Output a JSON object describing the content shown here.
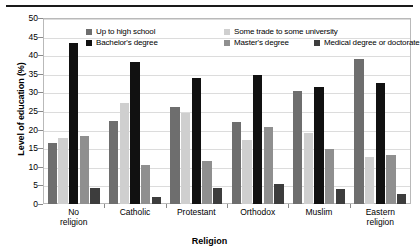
{
  "chart_data": {
    "type": "bar",
    "title": "",
    "xlabel": "Religion",
    "ylabel": "Level of education (%)",
    "ylim": [
      0,
      50
    ],
    "yticks": [
      0,
      5,
      10,
      15,
      20,
      25,
      30,
      35,
      40,
      45,
      50
    ],
    "grid": true,
    "legend_position": "top-inside",
    "categories": [
      "No\nreligion",
      "Catholic",
      "Protestant",
      "Orthodox",
      "Muslim",
      "Eastern\nreligion"
    ],
    "series": [
      {
        "name": "Up to high school",
        "color": "#6e6e6e",
        "values": [
          16.5,
          22.4,
          26.1,
          22.0,
          30.5,
          39.0
        ]
      },
      {
        "name": "Some trade to some university",
        "color": "#cfcfcf",
        "values": [
          17.7,
          27.1,
          24.4,
          17.1,
          19.2,
          12.7
        ]
      },
      {
        "name": "Bachelor's degree",
        "color": "#111111",
        "values": [
          43.3,
          38.1,
          33.9,
          34.6,
          31.4,
          32.4
        ]
      },
      {
        "name": "Master's degree",
        "color": "#8f8f8f",
        "values": [
          18.2,
          10.5,
          11.5,
          20.6,
          14.9,
          13.2
        ]
      },
      {
        "name": "Medical degree or doctorate",
        "color": "#3d3d3d",
        "values": [
          4.2,
          2.0,
          4.3,
          5.5,
          4.0,
          2.6
        ]
      }
    ]
  },
  "axis": {
    "ylabel": "Level of education (%)",
    "xlabel": "Religion"
  }
}
